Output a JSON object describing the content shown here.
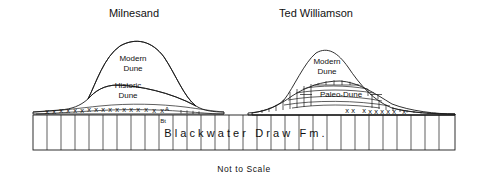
{
  "figure": {
    "caption": "Not to Scale",
    "formation_label": "Blackwater Draw Fm."
  },
  "sites": [
    {
      "key": "milnesand",
      "title": "Milnesand",
      "title_x": 134,
      "units": [
        {
          "name": "modern-dune",
          "label_line1": "Modern",
          "label_line2": "Dune",
          "fill": "#e9e9e9"
        },
        {
          "name": "historic-dune",
          "label_line1": "Historic",
          "label_line2": "Dune",
          "fill": "#a9a9a9"
        }
      ],
      "horizons": [
        {
          "name": "a-horizon",
          "label": "A"
        },
        {
          "name": "bt-horizon",
          "label": "Bt"
        }
      ],
      "caliche_marks": "x x x x x x x x x x x x x x x x x"
    },
    {
      "key": "ted-williamson",
      "title": "Ted Williamson",
      "title_x": 316,
      "units": [
        {
          "name": "modern-dune",
          "label_line1": "Modern",
          "label_line2": "Dune",
          "fill": "#e5e5e5"
        },
        {
          "name": "paleo-dune",
          "label": "Paleo-Dune",
          "fill": "#ffffff"
        }
      ],
      "caliche_marks": "x x   x x x x x x   x"
    }
  ],
  "colors": {
    "modern_dune_fill": "#e9e9e9",
    "historic_dune_fill": "#a9a9a9",
    "paleo_dune_fill": "#ffffff",
    "stroke": "#1a1a1a",
    "background": "#ffffff"
  }
}
